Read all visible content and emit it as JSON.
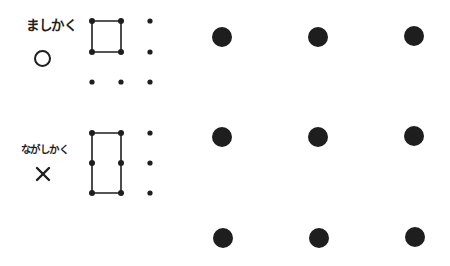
{
  "examples": [
    {
      "label": "ましかく",
      "verdict_symbol": "○",
      "verdict": "correct",
      "shape": "square",
      "grid": {
        "cols": 3,
        "rows": 3,
        "connected": [
          [
            0,
            0
          ],
          [
            1,
            0
          ],
          [
            1,
            1
          ],
          [
            0,
            1
          ]
        ]
      }
    },
    {
      "label": "ながしかく",
      "verdict_symbol": "×",
      "verdict": "incorrect",
      "shape": "rectangle",
      "grid": {
        "cols": 3,
        "rows": 3,
        "connected": [
          [
            0,
            0
          ],
          [
            1,
            0
          ],
          [
            1,
            1
          ],
          [
            1,
            2
          ],
          [
            0,
            2
          ],
          [
            0,
            1
          ]
        ]
      }
    }
  ],
  "puzzle_grid": {
    "cols": 3,
    "rows": 3,
    "dot_color": "#1e1e1e"
  }
}
